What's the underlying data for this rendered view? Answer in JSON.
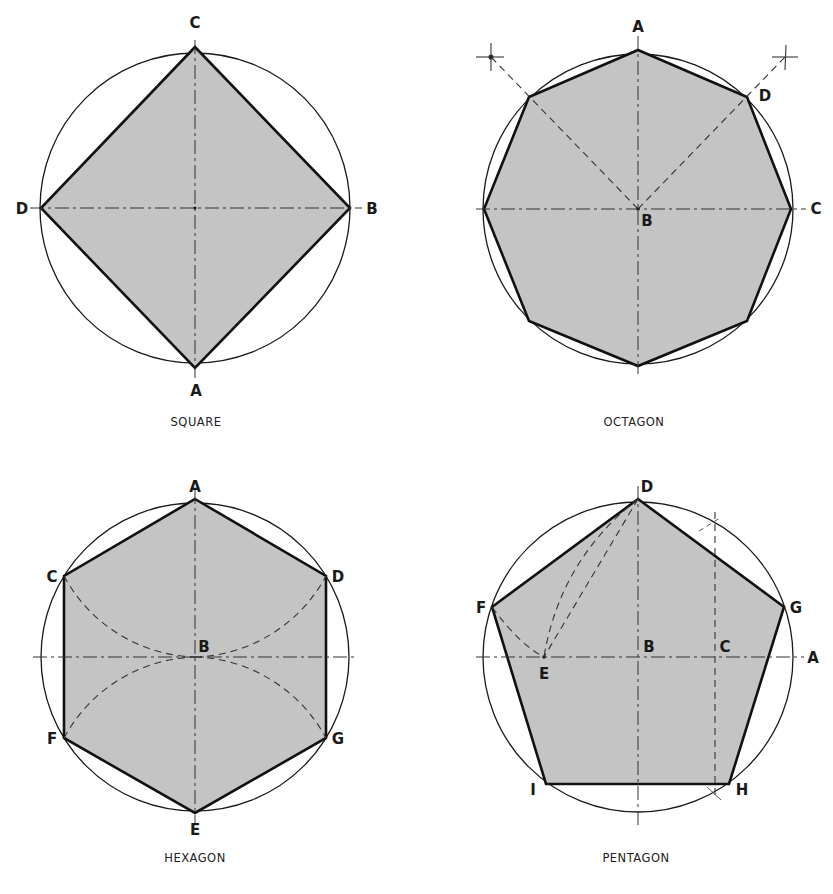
{
  "figures": [
    {
      "id": "square",
      "caption": "SQUARE",
      "center": [
        195,
        208
      ],
      "radius": 155,
      "labels": [
        {
          "text": "C",
          "x": 195,
          "y": 28
        },
        {
          "text": "B",
          "x": 372,
          "y": 214
        },
        {
          "text": "A",
          "x": 196,
          "y": 396
        },
        {
          "text": "D",
          "x": 22,
          "y": 214
        }
      ]
    },
    {
      "id": "octagon",
      "caption": "OCTAGON",
      "center": [
        638,
        209
      ],
      "radius": 155,
      "labels": [
        {
          "text": "A",
          "x": 638,
          "y": 32
        },
        {
          "text": "D",
          "x": 765,
          "y": 101
        },
        {
          "text": "B",
          "x": 647,
          "y": 226
        },
        {
          "text": "C",
          "x": 816,
          "y": 214
        }
      ]
    },
    {
      "id": "hexagon",
      "caption": "HEXAGON",
      "center": [
        195,
        657
      ],
      "radius": 154,
      "labels": [
        {
          "text": "A",
          "x": 195,
          "y": 492
        },
        {
          "text": "C",
          "x": 52,
          "y": 582
        },
        {
          "text": "D",
          "x": 338,
          "y": 582
        },
        {
          "text": "B",
          "x": 204,
          "y": 652
        },
        {
          "text": "F",
          "x": 52,
          "y": 744
        },
        {
          "text": "G",
          "x": 338,
          "y": 744
        },
        {
          "text": "E",
          "x": 195,
          "y": 835
        }
      ]
    },
    {
      "id": "pentagon",
      "caption": "PENTAGON",
      "center": [
        638,
        657
      ],
      "radius": 155,
      "labels": [
        {
          "text": "D",
          "x": 647,
          "y": 492
        },
        {
          "text": "F",
          "x": 481,
          "y": 613
        },
        {
          "text": "G",
          "x": 796,
          "y": 613
        },
        {
          "text": "B",
          "x": 649,
          "y": 652
        },
        {
          "text": "C",
          "x": 725,
          "y": 652
        },
        {
          "text": "A",
          "x": 813,
          "y": 663
        },
        {
          "text": "E",
          "x": 544,
          "y": 679
        },
        {
          "text": "I",
          "x": 533,
          "y": 795
        },
        {
          "text": "H",
          "x": 742,
          "y": 795
        }
      ]
    }
  ],
  "colors": {
    "fill": "#c4c4c4",
    "stroke": "#111111",
    "background": "#ffffff"
  }
}
